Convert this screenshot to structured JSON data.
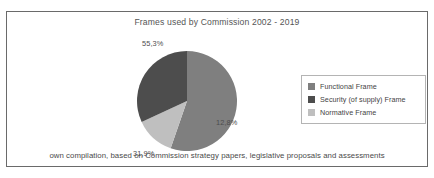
{
  "chart_data": {
    "type": "pie",
    "title": "Frames used by Commission 2002 - 2019",
    "caption": "own compilation, based on Commission strategy papers, legislative proposals and assessments",
    "categories": [
      "Functional Frame",
      "Security (of supply) Frame",
      "Normative Frame"
    ],
    "values": [
      55.3,
      31.9,
      12.8
    ],
    "value_labels": [
      "55,3%",
      "31,9%",
      "12,8%"
    ],
    "colors": [
      "#7f7f7f",
      "#4d4d4d",
      "#bfbfbf"
    ],
    "unit": "%",
    "legend_position": "right",
    "grid": false,
    "start_angle_deg": 0,
    "direction": "clockwise",
    "slices": [
      {
        "label": "Functional Frame",
        "value": 55.3,
        "value_label": "55,3%",
        "color": "#7f7f7f"
      },
      {
        "label": "Normative Frame",
        "value": 12.8,
        "value_label": "12,8%",
        "color": "#bfbfbf"
      },
      {
        "label": "Security (of supply) Frame",
        "value": 31.9,
        "value_label": "31,9%",
        "color": "#4d4d4d"
      }
    ]
  },
  "legend": {
    "items": [
      {
        "label": "Functional Frame",
        "color": "#7f7f7f"
      },
      {
        "label": "Security (of supply) Frame",
        "color": "#4d4d4d"
      },
      {
        "label": "Normative Frame",
        "color": "#bfbfbf"
      }
    ]
  },
  "frame": {
    "border_color": "#6a6a6a"
  }
}
